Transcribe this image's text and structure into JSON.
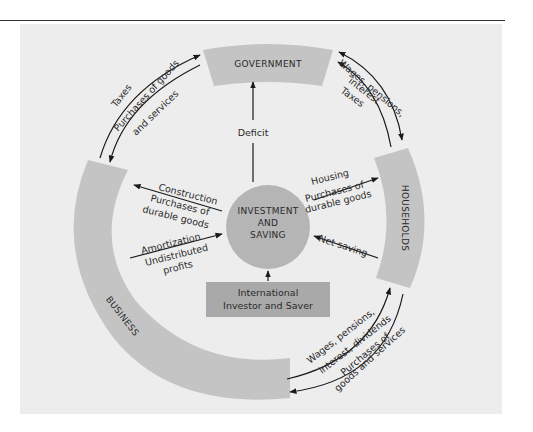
{
  "diagram": {
    "sectors": {
      "government": "GOVERNMENT",
      "households": "HOUSEHOLDS",
      "business": "BUSINESS"
    },
    "center": {
      "line1": "INVESTMENT",
      "line2": "AND",
      "line3": "SAVING"
    },
    "international": {
      "line1": "International",
      "line2": "Investor and Saver"
    },
    "flows": {
      "deficit": "Deficit",
      "gov_business_outer": "Taxes",
      "gov_business_inner1": "Purchases of goods",
      "gov_business_inner2": "and services",
      "gov_households_outer": "Wages, pensions,",
      "gov_households_mid": "interest",
      "gov_households_inner": "Taxes",
      "business_construction": "Construction",
      "business_purchases1": "Purchases of",
      "business_purchases2": "durable goods",
      "business_amortization": "Amortization",
      "business_undistributed1": "Undistributed",
      "business_undistributed2": "profits",
      "households_housing": "Housing",
      "households_purchases1": "Purchases of",
      "households_purchases2": "durable goods",
      "households_netsaving": "Net saving",
      "bh_wages1": "Wages, pensions,",
      "bh_wages2": "interest, dividends",
      "bh_purchases1": "Purchases of",
      "bh_purchases2": "goods and services"
    },
    "colors": {
      "panel": "#ededed",
      "ring": "#c4c4c4",
      "center": "#b5b5b5",
      "international": "#a9a9a9",
      "line": "#1a1a1a"
    }
  }
}
